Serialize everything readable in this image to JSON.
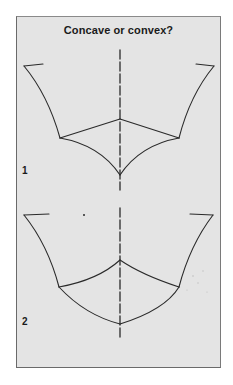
{
  "title": "Concave or convex?",
  "figures": [
    {
      "label": "1",
      "description": "Convex pyramid-like shape viewed from above with a dashed vertical axis; bottom curves bow inward (concave appearing)"
    },
    {
      "label": "2",
      "description": "Second variant with the same outline but bottom edges bowing outward (convex appearing)"
    }
  ],
  "colors": {
    "background": "#e4e4e4",
    "stroke": "#2a2a2a",
    "frame": "#6a6a6a",
    "page": "#ffffff"
  }
}
